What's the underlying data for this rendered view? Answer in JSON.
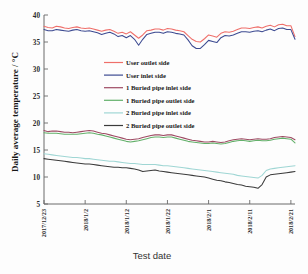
{
  "chart_data": {
    "type": "line",
    "title": "",
    "xlabel": "Test date",
    "ylabel": "Daily average temperature / °C",
    "ylim": [
      5,
      40
    ],
    "yticks": [
      5,
      10,
      15,
      20,
      25,
      30,
      35,
      40
    ],
    "ytick_labels": [
      "5",
      "10",
      "15",
      "20",
      "25",
      "30",
      "35",
      "40"
    ],
    "grid": false,
    "legend_position": "center",
    "x_tick_labels": [
      "2017/12/23",
      "2018/1/2",
      "2018/1/12",
      "2018/1/22",
      "2018/2/1",
      "2018/2/11",
      "2018/2/21"
    ],
    "x_tick_positions": [
      0,
      10,
      20,
      30,
      40,
      50,
      60
    ],
    "xlim": [
      0,
      61
    ],
    "x": [
      0,
      1,
      2,
      3,
      4,
      5,
      6,
      7,
      8,
      9,
      10,
      11,
      12,
      13,
      14,
      15,
      16,
      17,
      18,
      19,
      20,
      21,
      22,
      23,
      24,
      25,
      26,
      27,
      28,
      29,
      30,
      31,
      32,
      33,
      34,
      35,
      36,
      37,
      38,
      39,
      40,
      41,
      42,
      43,
      44,
      45,
      46,
      47,
      48,
      49,
      50,
      51,
      52,
      53,
      54,
      55,
      56,
      57,
      58,
      59,
      60,
      61
    ],
    "series": [
      {
        "name": "User outlet side",
        "color": "#ef6f6a",
        "values": [
          37.9,
          37.7,
          37.6,
          37.9,
          37.8,
          37.6,
          37.5,
          37.7,
          37.8,
          37.6,
          37.5,
          37.6,
          37.4,
          37.2,
          37.0,
          37.2,
          37.3,
          37.0,
          36.6,
          36.8,
          36.5,
          36.9,
          36.3,
          35.7,
          36.3,
          37.1,
          37.2,
          37.4,
          37.4,
          37.2,
          37.5,
          37.4,
          37.2,
          37.1,
          36.9,
          36.2,
          35.5,
          35.1,
          35.0,
          35.6,
          36.3,
          36.1,
          35.9,
          36.6,
          36.9,
          36.8,
          37.0,
          37.3,
          37.6,
          37.6,
          37.5,
          37.7,
          37.8,
          37.6,
          37.9,
          38.1,
          37.8,
          38.2,
          38.3,
          38.0,
          38.0,
          36.0
        ]
      },
      {
        "name": "User inlet side",
        "color": "#3c4a91",
        "values": [
          37.3,
          37.1,
          37.1,
          37.3,
          37.2,
          37.1,
          37.0,
          37.2,
          37.3,
          37.1,
          37.0,
          37.1,
          36.9,
          36.7,
          36.4,
          36.6,
          36.8,
          36.5,
          36.0,
          36.2,
          35.8,
          36.2,
          35.5,
          34.4,
          35.5,
          36.4,
          36.6,
          36.8,
          36.8,
          36.6,
          36.9,
          36.8,
          36.6,
          36.5,
          36.3,
          35.4,
          34.3,
          33.8,
          33.8,
          34.5,
          35.3,
          35.1,
          34.9,
          35.8,
          36.2,
          36.1,
          36.3,
          36.6,
          36.9,
          36.9,
          36.8,
          37.0,
          37.1,
          36.9,
          37.2,
          37.4,
          37.1,
          37.5,
          37.6,
          37.3,
          37.3,
          35.5
        ]
      },
      {
        "name": "1 Buried pipe inlet side",
        "color": "#9e4a63",
        "values": [
          18.6,
          18.4,
          18.5,
          18.5,
          18.4,
          18.3,
          18.3,
          18.2,
          18.3,
          18.4,
          18.5,
          18.6,
          18.5,
          18.3,
          18.1,
          18.0,
          17.8,
          17.6,
          17.4,
          17.2,
          17.0,
          16.9,
          17.0,
          17.1,
          17.3,
          17.5,
          17.7,
          17.8,
          17.8,
          17.7,
          17.8,
          17.8,
          17.6,
          17.4,
          17.2,
          17.0,
          16.8,
          16.7,
          16.6,
          16.5,
          16.5,
          16.6,
          16.5,
          16.4,
          16.5,
          16.7,
          16.9,
          17.0,
          17.1,
          17.0,
          16.9,
          17.0,
          17.1,
          17.0,
          17.0,
          17.1,
          17.3,
          17.4,
          17.5,
          17.4,
          17.3,
          16.9
        ]
      },
      {
        "name": "1  Buried pipe outlet side",
        "color": "#63b06a",
        "values": [
          18.2,
          18.1,
          18.1,
          18.1,
          18.0,
          17.9,
          17.9,
          17.9,
          17.9,
          18.0,
          18.1,
          18.2,
          18.1,
          17.9,
          17.8,
          17.6,
          17.4,
          17.2,
          17.0,
          16.8,
          16.6,
          16.5,
          16.6,
          16.7,
          16.9,
          17.1,
          17.3,
          17.4,
          17.4,
          17.3,
          17.4,
          17.4,
          17.2,
          17.0,
          16.8,
          16.6,
          16.5,
          16.4,
          16.3,
          16.2,
          16.2,
          16.3,
          16.2,
          16.1,
          16.2,
          16.4,
          16.6,
          16.7,
          16.8,
          16.7,
          16.6,
          16.7,
          16.8,
          16.7,
          16.7,
          16.8,
          17.0,
          17.1,
          17.2,
          17.1,
          17.0,
          16.3
        ]
      },
      {
        "name": "2 Buried pipe inlet side",
        "color": "#9fd6d4",
        "values": [
          14.3,
          14.2,
          14.1,
          14.0,
          13.9,
          13.8,
          13.7,
          13.6,
          13.6,
          13.5,
          13.4,
          13.4,
          13.3,
          13.2,
          13.1,
          13.0,
          12.9,
          12.9,
          12.8,
          12.7,
          12.6,
          12.5,
          12.5,
          12.4,
          12.3,
          12.3,
          12.3,
          12.3,
          12.2,
          12.1,
          12.1,
          12.0,
          11.9,
          11.8,
          11.7,
          11.6,
          11.5,
          11.4,
          11.3,
          11.2,
          11.1,
          11.0,
          10.9,
          10.8,
          10.7,
          10.6,
          10.5,
          10.3,
          10.2,
          10.1,
          10.0,
          9.9,
          9.8,
          10.3,
          11.2,
          11.5,
          11.6,
          11.7,
          11.8,
          11.9,
          12.0,
          12.1
        ]
      },
      {
        "name": "2  Buried pipe outlet side",
        "color": "#3b3b3b",
        "values": [
          13.4,
          13.3,
          13.2,
          13.1,
          13.0,
          12.9,
          12.8,
          12.7,
          12.6,
          12.5,
          12.4,
          12.4,
          12.3,
          12.2,
          12.1,
          12.0,
          11.9,
          11.8,
          11.8,
          11.7,
          11.7,
          11.6,
          11.5,
          11.3,
          11.0,
          11.1,
          11.2,
          11.3,
          11.1,
          11.0,
          10.9,
          10.8,
          10.7,
          10.6,
          10.5,
          10.4,
          10.3,
          10.2,
          10.1,
          10.0,
          9.8,
          9.6,
          9.4,
          9.3,
          9.1,
          9.0,
          8.8,
          8.6,
          8.5,
          8.3,
          8.2,
          8.1,
          7.9,
          8.6,
          10.0,
          10.4,
          10.5,
          10.6,
          10.7,
          10.8,
          10.9,
          11.0
        ]
      }
    ],
    "legend": [
      {
        "label": "User outlet side",
        "color": "#ef6f6a"
      },
      {
        "label": "User inlet side",
        "color": "#3c4a91"
      },
      {
        "label": "1 Buried pipe inlet side",
        "color": "#9e4a63"
      },
      {
        "label": "1  Buried pipe outlet side",
        "color": "#63b06a"
      },
      {
        "label": "2 Buried pipe inlet side",
        "color": "#9fd6d4"
      },
      {
        "label": "2  Buried pipe outlet side",
        "color": "#3b3b3b"
      }
    ]
  }
}
